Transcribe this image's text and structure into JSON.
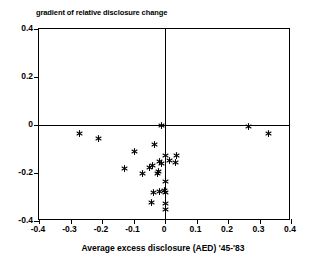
{
  "chart_data": {
    "type": "scatter",
    "title": "gradient of relative disclosure change",
    "xlabel": "Average excess disclosure (AED) '45-'83",
    "ylabel": "",
    "xlim": [
      -0.4,
      0.4
    ],
    "ylim": [
      -0.4,
      0.4
    ],
    "xticks": [
      "-0.4",
      "-0.3",
      "-0.2",
      "-0.1",
      "0",
      "0.1",
      "0.2",
      "0.3",
      "0.4"
    ],
    "xtick_values": [
      -0.4,
      -0.3,
      -0.2,
      -0.1,
      0,
      0.1,
      0.2,
      0.3,
      0.4
    ],
    "yticks": [
      "0.4",
      "0.2",
      "0",
      "-0.2",
      "-0.4"
    ],
    "ytick_values": [
      0.4,
      0.2,
      0,
      -0.2,
      -0.4
    ],
    "grid": false,
    "legend": null,
    "marker": "asterisk",
    "marker_color": "#000000",
    "axis_cross_x": 0,
    "axis_cross_y": 0,
    "points": [
      {
        "x": -0.273,
        "y": -0.037
      },
      {
        "x": -0.21,
        "y": -0.058
      },
      {
        "x": -0.098,
        "y": -0.112
      },
      {
        "x": -0.032,
        "y": -0.083
      },
      {
        "x": -0.01,
        "y": -0.004
      },
      {
        "x": 0.003,
        "y": -0.129
      },
      {
        "x": 0.038,
        "y": -0.125
      },
      {
        "x": -0.127,
        "y": -0.183
      },
      {
        "x": -0.07,
        "y": -0.204
      },
      {
        "x": -0.048,
        "y": -0.175
      },
      {
        "x": -0.01,
        "y": -0.162
      },
      {
        "x": -0.016,
        "y": -0.15
      },
      {
        "x": -0.022,
        "y": -0.192
      },
      {
        "x": -0.025,
        "y": -0.2
      },
      {
        "x": -0.041,
        "y": -0.17
      },
      {
        "x": 0.013,
        "y": -0.146
      },
      {
        "x": 0.032,
        "y": -0.158
      },
      {
        "x": 0.003,
        "y": -0.237
      },
      {
        "x": -0.038,
        "y": -0.283
      },
      {
        "x": -0.044,
        "y": -0.321
      },
      {
        "x": -0.016,
        "y": -0.275
      },
      {
        "x": 0.003,
        "y": -0.283
      },
      {
        "x": 0.003,
        "y": -0.325
      },
      {
        "x": 0.003,
        "y": -0.35
      },
      {
        "x": -0.003,
        "y": -0.271
      },
      {
        "x": 0.266,
        "y": -0.008
      },
      {
        "x": 0.327,
        "y": -0.037
      }
    ]
  }
}
